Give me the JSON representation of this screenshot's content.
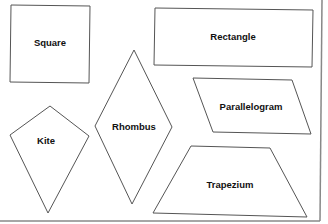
{
  "diagram": {
    "shapes": [
      {
        "name": "Square",
        "label": "Square"
      },
      {
        "name": "Rectangle",
        "label": "Rectangle"
      },
      {
        "name": "Rhombus",
        "label": "Rhombus"
      },
      {
        "name": "Kite",
        "label": "Kite"
      },
      {
        "name": "Parallelogram",
        "label": "Parallelogram"
      },
      {
        "name": "Trapezium",
        "label": "Trapezium"
      }
    ]
  }
}
